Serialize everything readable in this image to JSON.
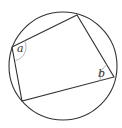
{
  "diagram": {
    "type": "cyclic-quadrilateral",
    "circle": {
      "cx": 63,
      "cy": 66,
      "r": 54,
      "stroke": "#333333"
    },
    "vertices": [
      {
        "id": "A",
        "x": 12,
        "y": 47
      },
      {
        "id": "B",
        "x": 77,
        "y": 15
      },
      {
        "id": "C",
        "x": 114,
        "y": 77
      },
      {
        "id": "D",
        "x": 22,
        "y": 101
      }
    ],
    "angle_labels": [
      {
        "vertex": "A",
        "text": "a",
        "x": 18,
        "y": 53
      },
      {
        "vertex": "C",
        "text": "b",
        "x": 98,
        "y": 75
      }
    ],
    "arc_color": "#aaaaaa"
  }
}
